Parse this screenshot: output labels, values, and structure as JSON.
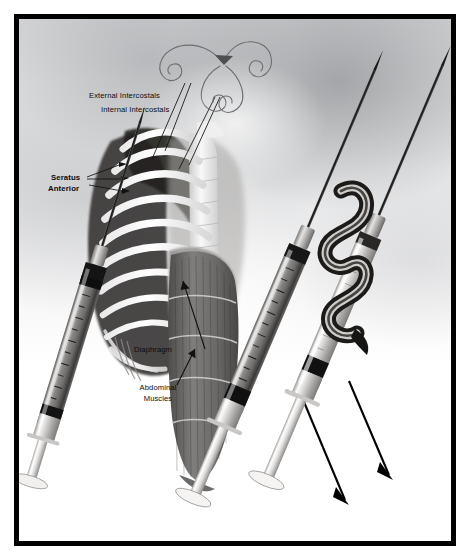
{
  "figure": {
    "kind": "anatomical-medical-illustration",
    "background_color": "#ffffff",
    "frame_color": "#000000",
    "ink_color": "#0b0b0b"
  },
  "labels": [
    {
      "id": "external-intercostals",
      "text": "External Intercostals",
      "bold": false,
      "x": 88,
      "y": 86
    },
    {
      "id": "internal-intercostals",
      "text": "Internal Intercostals",
      "bold": false,
      "x": 100,
      "y": 100
    },
    {
      "id": "seratus-anterior-1",
      "text": "Seratus",
      "bold": true,
      "x": 50,
      "y": 168
    },
    {
      "id": "seratus-anterior-2",
      "text": "Anterior",
      "bold": true,
      "x": 47,
      "y": 179
    },
    {
      "id": "diaphragm",
      "text": "Diaphragm",
      "bold": false,
      "x": 133,
      "y": 340
    },
    {
      "id": "abdominal-muscles-1",
      "text": "Abdominal",
      "bold": false,
      "x": 128,
      "y": 378
    },
    {
      "id": "abdominal-muscles-2",
      "text": "Muscles",
      "bold": false,
      "x": 133,
      "y": 390
    }
  ],
  "anatomy": {
    "rib_cage": {
      "rib_count": 9,
      "fill": "#ffffff",
      "shadow": "#2a2a2c"
    },
    "spine": {
      "vertebra_count": 9,
      "fill": "#f2f2f2"
    },
    "abdominal_muscles": {
      "band_count": 5,
      "fill": "#6f6d6b"
    },
    "diaphragm": {
      "fill": "#8a8887"
    }
  },
  "syringes": [
    {
      "id": "syringe-left",
      "angle_deg": 17,
      "barrel_tone": "dark",
      "has_arrow": false
    },
    {
      "id": "syringe-middle",
      "angle_deg": 23,
      "barrel_tone": "dark",
      "has_arrow": true
    },
    {
      "id": "syringe-right",
      "angle_deg": 23,
      "barrel_tone": "light",
      "has_arrow": true
    }
  ],
  "annotations": {
    "swirl_motif": {
      "id": "airflow-swirl",
      "stroke": "#6e6e70",
      "description": "decorative curled airflow flourish with arrowhead at needle tip"
    },
    "arrows": [
      {
        "id": "plunger-arrow-1",
        "direction": "down-right"
      },
      {
        "id": "plunger-arrow-2",
        "direction": "down-right"
      }
    ]
  }
}
